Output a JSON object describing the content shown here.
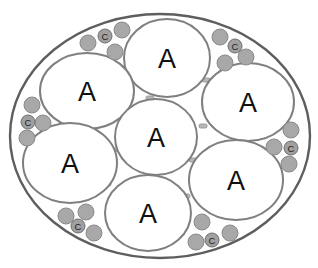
{
  "diagram": {
    "type": "cross-section schematic",
    "outer_boundary": {
      "shape": "ellipse",
      "cx": 160,
      "cy": 136,
      "rx": 150,
      "ry": 122
    },
    "large_cells": [
      {
        "id": "A1",
        "label": "A",
        "cx": 167,
        "cy": 58,
        "rx": 43,
        "ry": 39
      },
      {
        "id": "A2",
        "label": "A",
        "cx": 87,
        "cy": 91,
        "rx": 47,
        "ry": 38
      },
      {
        "id": "A3",
        "label": "A",
        "cx": 248,
        "cy": 102,
        "rx": 46,
        "ry": 39
      },
      {
        "id": "A4",
        "label": "A",
        "cx": 156,
        "cy": 137,
        "rx": 41,
        "ry": 38
      },
      {
        "id": "A5",
        "label": "A",
        "cx": 70,
        "cy": 163,
        "rx": 47,
        "ry": 40
      },
      {
        "id": "A6",
        "label": "A",
        "cx": 236,
        "cy": 180,
        "rx": 47,
        "ry": 40
      },
      {
        "id": "A7",
        "label": "A",
        "cx": 148,
        "cy": 213,
        "rx": 43,
        "ry": 38
      }
    ],
    "small_clusters": [
      {
        "id": "c-top-left",
        "label": "C",
        "label_cx": 105,
        "label_cy": 36,
        "circles": [
          {
            "cx": 88,
            "cy": 43
          },
          {
            "cx": 122,
            "cy": 30
          },
          {
            "cx": 115,
            "cy": 52
          }
        ]
      },
      {
        "id": "c-top-right",
        "label": "C",
        "label_cx": 235,
        "label_cy": 46,
        "circles": [
          {
            "cx": 220,
            "cy": 37
          },
          {
            "cx": 246,
            "cy": 57
          },
          {
            "cx": 225,
            "cy": 63
          }
        ]
      },
      {
        "id": "c-left",
        "label": "C",
        "label_cx": 28,
        "label_cy": 122,
        "circles": [
          {
            "cx": 32,
            "cy": 105
          },
          {
            "cx": 43,
            "cy": 123
          },
          {
            "cx": 27,
            "cy": 138
          }
        ]
      },
      {
        "id": "c-right",
        "label": "C",
        "label_cx": 291,
        "label_cy": 148,
        "circles": [
          {
            "cx": 291,
            "cy": 130
          },
          {
            "cx": 274,
            "cy": 147
          },
          {
            "cx": 289,
            "cy": 164
          }
        ]
      },
      {
        "id": "c-bottom-left",
        "label": "C",
        "label_cx": 78,
        "label_cy": 226,
        "circles": [
          {
            "cx": 66,
            "cy": 216
          },
          {
            "cx": 86,
            "cy": 212
          },
          {
            "cx": 94,
            "cy": 233
          }
        ]
      },
      {
        "id": "c-bottom-right",
        "label": "C",
        "label_cx": 212,
        "label_cy": 240,
        "circles": [
          {
            "cx": 202,
            "cy": 222
          },
          {
            "cx": 196,
            "cy": 242
          },
          {
            "cx": 230,
            "cy": 233
          }
        ]
      }
    ],
    "junctions": [
      {
        "x": 126,
        "y": 71
      },
      {
        "x": 206,
        "y": 80
      },
      {
        "x": 124,
        "y": 113
      },
      {
        "x": 203,
        "y": 126
      },
      {
        "x": 113,
        "y": 150
      },
      {
        "x": 193,
        "y": 160
      },
      {
        "x": 107,
        "y": 184
      },
      {
        "x": 186,
        "y": 196
      },
      {
        "x": 80,
        "y": 127
      },
      {
        "x": 150,
        "y": 98
      },
      {
        "x": 153,
        "y": 175
      },
      {
        "x": 240,
        "y": 140
      }
    ],
    "colors": {
      "outer_stroke": "#5e5e5e",
      "cell_stroke": "#7f7f7f",
      "small_fill": "#a8a8a8",
      "label": "#111111"
    }
  }
}
